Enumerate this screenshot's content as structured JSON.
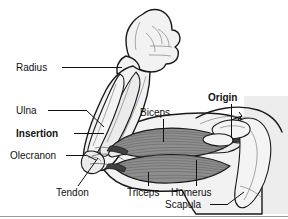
{
  "figure": {
    "background_color": "#ffffff",
    "panel_color": "#ededed",
    "ink_color": "#1a1a1a",
    "muscle_color": "#8f8f8f",
    "muscle_color_dark": "#6e6e6e",
    "bone_color": "#ebebeb",
    "tendon_color": "#3f3f3f",
    "width": 288,
    "height": 219
  },
  "labels": {
    "radius": "Radius",
    "ulna": "Ulna",
    "insertion": "Insertion",
    "olecranon": "Olecranon",
    "tendon": "Tendon",
    "biceps": "Biceps",
    "triceps": "Triceps",
    "humerus": "Humerus",
    "scapula": "Scapula",
    "origin": "Origin"
  },
  "label_styles": {
    "radius": "regular",
    "ulna": "regular",
    "insertion": "bold",
    "olecranon": "regular",
    "tendon": "regular",
    "biceps": "regular",
    "triceps": "regular",
    "humerus": "regular",
    "scapula": "regular",
    "origin": "bold"
  },
  "parts": {
    "fist": "clenched-fist",
    "forearm": "forearm",
    "upper_arm": "upper-arm",
    "biceps_muscle": "biceps-brachii",
    "triceps_muscle": "triceps-brachii",
    "humerus_bone": "humerus",
    "radius_bone": "radius",
    "ulna_bone": "ulna",
    "scapula_bone": "scapula",
    "olecranon_process": "olecranon",
    "tendon_distal": "distal-tendon"
  }
}
